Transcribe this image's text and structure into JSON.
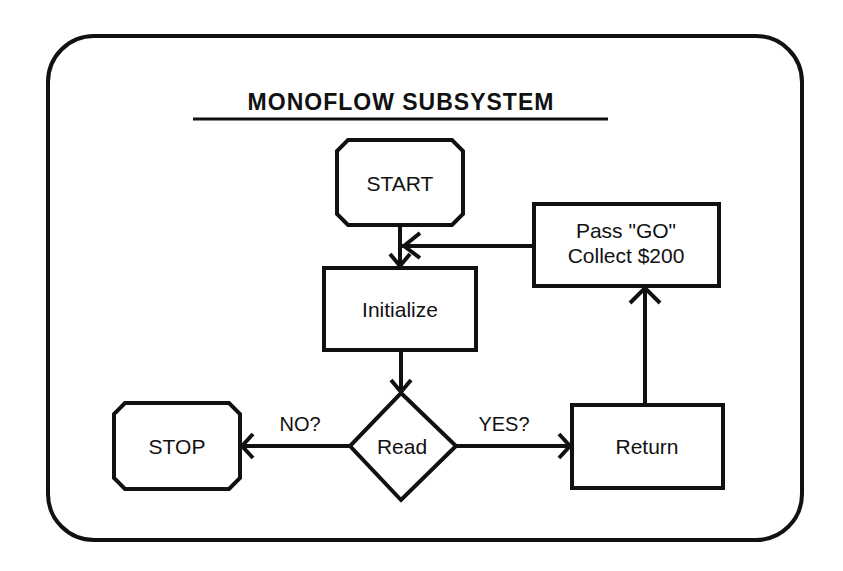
{
  "diagram": {
    "title": "MONOFLOW SUBSYSTEM",
    "colors": {
      "stroke": "#111111",
      "background": "#ffffff"
    },
    "nodes": {
      "start": {
        "label": "START",
        "shape": "octagon"
      },
      "initialize": {
        "label": "Initialize",
        "shape": "rectangle"
      },
      "read": {
        "label": "Read",
        "shape": "diamond"
      },
      "stop": {
        "label": "STOP",
        "shape": "octagon"
      },
      "return": {
        "label": "Return",
        "shape": "rectangle"
      },
      "pass_go": {
        "line1": "Pass \"GO\"",
        "line2": "Collect $200",
        "shape": "rectangle"
      }
    },
    "edges": {
      "no_label": "NO?",
      "yes_label": "YES?"
    },
    "edge_list": [
      {
        "from": "START",
        "to": "Initialize",
        "label": ""
      },
      {
        "from": "Initialize",
        "to": "Read",
        "label": ""
      },
      {
        "from": "Read",
        "to": "STOP",
        "label": "NO?"
      },
      {
        "from": "Read",
        "to": "Return",
        "label": "YES?"
      },
      {
        "from": "Return",
        "to": "Pass \"GO\" Collect $200",
        "label": ""
      },
      {
        "from": "Pass \"GO\" Collect $200",
        "to": "Initialize",
        "label": ""
      }
    ]
  }
}
